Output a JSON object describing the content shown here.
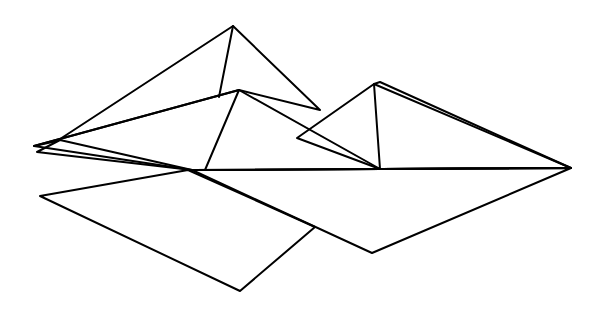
{
  "diagram": {
    "type": "folded-paper-polygons",
    "colors": {
      "background": "#ffffff",
      "light_gray": "#cbcbcb",
      "dark_gray": "#999999",
      "white": "#fdfdfd",
      "stroke": "#000000"
    },
    "shapes": [
      {
        "name": "light-gray-pyramid",
        "fill": "light_gray"
      },
      {
        "name": "white-upper-diamond",
        "fill": "white"
      },
      {
        "name": "dark-gray-upper-triangle",
        "fill": "dark_gray"
      },
      {
        "name": "dark-gray-lower-quad",
        "fill": "dark_gray"
      },
      {
        "name": "white-lower-triangle",
        "fill": "white"
      }
    ]
  }
}
